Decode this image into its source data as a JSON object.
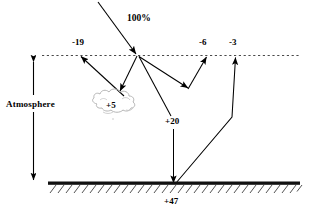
{
  "diagram": {
    "title_text": "Earth radiation budget diagram",
    "labels": {
      "incoming": "100%",
      "reflected_atmosphere": "-19",
      "reflected_clouds": "-6",
      "reflected_surface": "-3",
      "absorbed_clouds": "+5",
      "absorbed_atmosphere": "+20",
      "absorbed_surface": "+47",
      "atmosphere": "Atmosphere"
    },
    "colors": {
      "ink": "#000000",
      "cloud_outline": "#b0b0b0",
      "ground": "#111111",
      "dashed_line": "#555555"
    },
    "elements": {
      "dashed_boundary": "top-of-atmosphere-dashed-line",
      "ground_bar": "earth-surface-bar",
      "hatching": "ground-hatching",
      "cloud": "cloud-shape",
      "atmosphere_scale": "atmosphere-double-arrow"
    }
  }
}
